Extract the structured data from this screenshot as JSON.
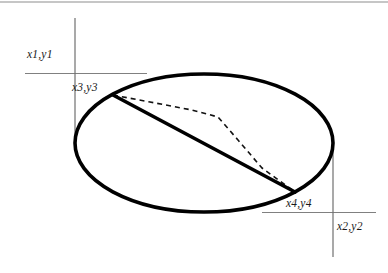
{
  "figure": {
    "background_color": "#ffffff",
    "stroke_color": "#000000",
    "axis_color": "#808080",
    "width": 388,
    "height": 273
  },
  "labels": {
    "x1y1": "x1,y1",
    "x3y3": "x3,y3",
    "x4y4": "x4,y4",
    "x2y2": "x2,y2"
  },
  "geometry": {
    "ellipse": {
      "name": "ellipse-shape",
      "cx": 204,
      "cy": 143,
      "rx": 129,
      "ry": 69,
      "stroke_width": 3.6
    },
    "bounding_box": {
      "left_x": 75,
      "right_x": 333,
      "top_y": 73.5,
      "bottom_y": 212.5
    },
    "guide_lines": [
      {
        "name": "top-horizontal-guide",
        "x1": 25,
        "y1": 73.5,
        "x2": 147,
        "y2": 73.5
      },
      {
        "name": "left-vertical-guide",
        "x1": 75,
        "y1": 18,
        "x2": 75,
        "y2": 150
      },
      {
        "name": "bottom-horizontal-guide",
        "x1": 262,
        "y1": 212.5,
        "x2": 376,
        "y2": 212.5
      },
      {
        "name": "right-vertical-guide",
        "x1": 333,
        "y1": 135,
        "x2": 333,
        "y2": 257
      },
      {
        "name": "page-top-edge-artifact",
        "x1": 0,
        "y1": 2,
        "x2": 388,
        "y2": 2
      }
    ],
    "chord": {
      "name": "solid-chord",
      "x1": 113,
      "y1": 95,
      "x2": 295,
      "y2": 192,
      "stroke_width": 3.6
    },
    "dashed_polyline": {
      "name": "dashed-polyline",
      "points": "113,95 150,102 192,110 218,117 238,140 262,168 295,192",
      "stroke_width": 1.6,
      "dash_pattern": "5 4"
    }
  },
  "points": [
    {
      "id": "x1y1",
      "role": "bounding-box-top-left-corner",
      "x": 75,
      "y": 73.5
    },
    {
      "id": "x2y2",
      "role": "bounding-box-bottom-right-corner",
      "x": 333,
      "y": 212.5
    },
    {
      "id": "x3y3",
      "role": "chord-start-on-ellipse",
      "x": 113,
      "y": 95
    },
    {
      "id": "x4y4",
      "role": "chord-end-on-ellipse",
      "x": 295,
      "y": 192
    }
  ]
}
